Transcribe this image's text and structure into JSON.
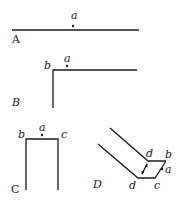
{
  "panels": {
    "A": {
      "label": "A",
      "points": {
        "a": "a"
      }
    },
    "B": {
      "label": "B",
      "points": {
        "a": "a",
        "b": "b"
      }
    },
    "C": {
      "label": "C",
      "points": {
        "a": "a",
        "b": "b",
        "c": "c"
      }
    },
    "D": {
      "label": "D",
      "points": {
        "a": "a",
        "b": "b",
        "c": "c",
        "d_top": "d",
        "d_bottom": "d"
      }
    }
  },
  "colors": {
    "ink": "#1a1a1a",
    "background": "#ffffff"
  }
}
